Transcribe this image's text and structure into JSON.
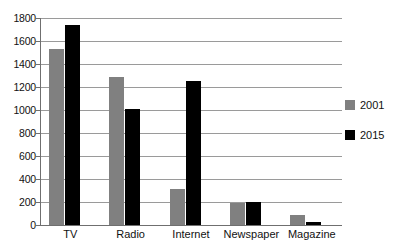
{
  "chart_data": {
    "type": "bar",
    "title": "",
    "xlabel": "",
    "ylabel": "",
    "categories": [
      "TV",
      "Radio",
      "Internet",
      "Newspaper",
      "Magazine"
    ],
    "series": [
      {
        "name": "2001",
        "color": "#808080",
        "values": [
          1530,
          1290,
          315,
          190,
          85
        ]
      },
      {
        "name": "2015",
        "color": "#000000",
        "values": [
          1740,
          1010,
          1250,
          200,
          25
        ]
      }
    ],
    "ylim": [
      0,
      1800
    ],
    "ytick_step": 200,
    "yticks": [
      0,
      200,
      400,
      600,
      800,
      1000,
      1200,
      1400,
      1600,
      1800
    ],
    "ytick_labels": [
      "0",
      "200",
      "400",
      "600",
      "800",
      "1000",
      "1200",
      "1400",
      "1600",
      "1800"
    ],
    "grid": true,
    "grid_axis": "y",
    "legend_position": "right",
    "background": "#ffffff",
    "axis_color": "#6f6f6f",
    "grid_color": "#9a9a9a"
  },
  "legend": {
    "items": [
      {
        "label": "2001",
        "swatch": "legend-swatch-2001"
      },
      {
        "label": "2015",
        "swatch": "legend-swatch-2015"
      }
    ]
  }
}
